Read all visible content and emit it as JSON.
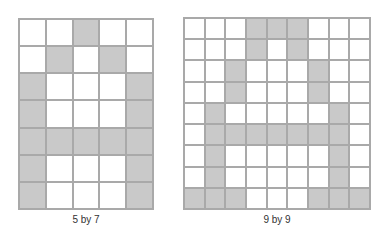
{
  "figures": [
    {
      "label": "5 by 7",
      "cols": 5,
      "rows": 7,
      "pattern": [
        [
          0,
          0,
          1,
          0,
          0
        ],
        [
          0,
          1,
          0,
          1,
          0
        ],
        [
          1,
          0,
          0,
          0,
          1
        ],
        [
          1,
          0,
          0,
          0,
          1
        ],
        [
          1,
          1,
          1,
          1,
          1
        ],
        [
          1,
          0,
          0,
          0,
          1
        ],
        [
          1,
          0,
          0,
          0,
          1
        ]
      ]
    },
    {
      "label": "9 by 9",
      "cols": 9,
      "rows": 9,
      "pattern": [
        [
          0,
          0,
          0,
          1,
          1,
          1,
          0,
          0,
          0
        ],
        [
          0,
          0,
          0,
          1,
          0,
          1,
          0,
          0,
          0
        ],
        [
          0,
          0,
          1,
          0,
          0,
          0,
          1,
          0,
          0
        ],
        [
          0,
          0,
          1,
          0,
          0,
          0,
          1,
          0,
          0
        ],
        [
          0,
          1,
          0,
          0,
          0,
          0,
          0,
          1,
          0
        ],
        [
          0,
          1,
          1,
          1,
          1,
          1,
          1,
          1,
          0
        ],
        [
          0,
          1,
          0,
          0,
          0,
          0,
          0,
          1,
          0
        ],
        [
          0,
          1,
          0,
          0,
          0,
          0,
          0,
          1,
          0
        ],
        [
          1,
          1,
          1,
          0,
          0,
          0,
          1,
          1,
          1
        ]
      ]
    }
  ],
  "colors": {
    "grid_line": "#a9a9a9",
    "filled": "#c9c9c9",
    "empty": "#ffffff"
  }
}
